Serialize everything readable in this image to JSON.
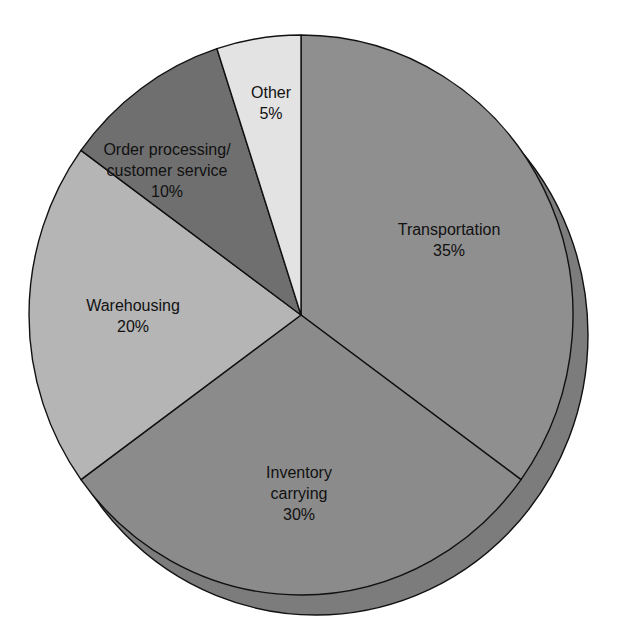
{
  "chart_data": {
    "type": "pie",
    "title": "",
    "start_angle_deg": 0,
    "direction": "clockwise",
    "slices": [
      {
        "label": "Transportation",
        "value": 35,
        "display": "35%",
        "color": "#8f8f8f",
        "label_lines": [
          "Transportation",
          "35%"
        ],
        "label_pos": [
          449,
          235
        ]
      },
      {
        "label": "Inventory carrying",
        "value": 30,
        "display": "30%",
        "color": "#8b8b8b",
        "label_lines": [
          "Inventory",
          "carrying",
          "30%"
        ],
        "label_pos": [
          299,
          478
        ]
      },
      {
        "label": "Warehousing",
        "value": 20,
        "display": "20%",
        "color": "#b5b5b5",
        "label_lines": [
          "Warehousing",
          "20%"
        ],
        "label_pos": [
          133,
          311
        ]
      },
      {
        "label": "Order processing/customer service",
        "value": 10,
        "display": "10%",
        "color": "#6f6f6f",
        "label_lines": [
          "Order processing/",
          "customer service",
          "10%"
        ],
        "label_pos": [
          167,
          155
        ]
      },
      {
        "label": "Other",
        "value": 5,
        "display": "5%",
        "color": "#e3e3e3",
        "label_lines": [
          "Other",
          "5%"
        ],
        "label_pos": [
          271,
          98
        ]
      }
    ],
    "shadow": {
      "color": "#7c7c7c",
      "dx": 15,
      "dy": 20
    },
    "geometry": {
      "cx": 301,
      "cy": 315,
      "rx": 272,
      "ry": 280
    },
    "legend": "none"
  }
}
